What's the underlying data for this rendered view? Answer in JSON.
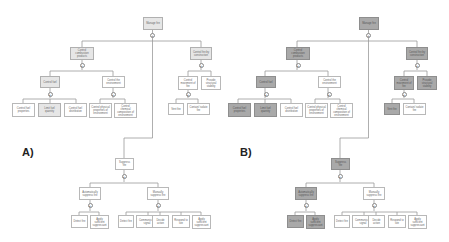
{
  "panels": [
    {
      "label": "A)",
      "nodes": {
        "manage_fire": "Manage fire",
        "control_combustion": "Control combustion products",
        "control_by_construction": "Control fire by construction",
        "control_fuel": "Control fuel",
        "control_environment": "Control the environment",
        "fuel_properties": "Control fuel properties",
        "limit_fuel": "Limit fuel quantity",
        "fuel_distribution": "Control fuel distribution",
        "env_physical": "Control physical properties of environment",
        "env_chemical": "Control chemical composition of environment",
        "control_movement": "Control movement of fire",
        "structural_stability": "Provide structural stability",
        "vent_fire": "Vent fire",
        "contain_fire": "Contain/ isolate fire",
        "suppress_fire": "Suppress fire",
        "auto_suppress": "Automatically suppress fire",
        "manual_suppress": "Manually suppress fire",
        "auto_detect": "Detect fire",
        "auto_apply": "Apply sufficient suppressant",
        "man_detect": "Detect fire",
        "man_communicate": "Communicate signal",
        "man_decide": "Decide action",
        "man_respond": "Respond to site",
        "man_apply": "Apply sufficient suppressant"
      }
    },
    {
      "label": "B)",
      "nodes": {
        "manage_fire": "Manage fire",
        "control_combustion": "Control combustion products",
        "control_by_construction": "Control fire by construction",
        "control_fuel": "Control fuel",
        "control_environment": "Control the environment",
        "fuel_properties": "Control fuel properties",
        "limit_fuel": "Limit fuel quantity",
        "fuel_distribution": "Control fuel distribution",
        "env_physical": "Control physical properties of environment",
        "env_chemical": "Control chemical composition of environment",
        "control_movement": "Control movement of fire",
        "structural_stability": "Provide structural stability",
        "vent_fire": "Vent fire",
        "contain_fire": "Contain/ isolate fire",
        "suppress_fire": "Suppress fire",
        "auto_suppress": "Automatically suppress fire",
        "manual_suppress": "Manually suppress fire",
        "auto_detect": "Detect fire",
        "auto_apply": "Apply sufficient suppressant",
        "man_detect": "Detect fire",
        "man_communicate": "Communicate signal",
        "man_decide": "Decide action",
        "man_respond": "Respond to site",
        "man_apply": "Apply sufficient suppressant"
      }
    }
  ],
  "gate_symbol": "+",
  "colors": {
    "line": "#9a9a9a",
    "node_border": "#b8b8b8",
    "highlight_light": "#e6e6e6",
    "highlight_dark": "#a9a9a9"
  }
}
